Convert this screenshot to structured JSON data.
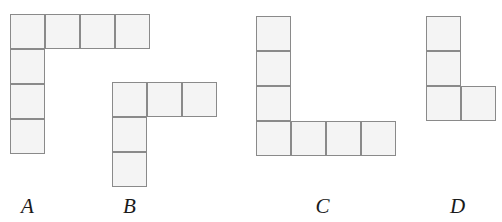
{
  "figure": {
    "kind": "polyomino-shape-set",
    "background_color": "#ffffff",
    "cell_fill_color": "#f4f4f4",
    "cell_border_color": "#8a8a8a",
    "label_color": "#1a1a1a",
    "cell_size_px": 35,
    "shapes": [
      {
        "id": "A",
        "label": "A",
        "cell_count": 7,
        "origin": {
          "x": 10,
          "y": 14
        },
        "label_pos": {
          "x": 10,
          "y": 196,
          "width": 35
        },
        "cells": [
          {
            "col": 0,
            "row": 0
          },
          {
            "col": 1,
            "row": 0
          },
          {
            "col": 2,
            "row": 0
          },
          {
            "col": 3,
            "row": 0
          },
          {
            "col": 0,
            "row": 1
          },
          {
            "col": 0,
            "row": 2
          },
          {
            "col": 0,
            "row": 3
          }
        ]
      },
      {
        "id": "B",
        "label": "B",
        "cell_count": 5,
        "origin": {
          "x": 112,
          "y": 82
        },
        "label_pos": {
          "x": 112,
          "y": 196,
          "width": 35
        },
        "cells": [
          {
            "col": 0,
            "row": 0
          },
          {
            "col": 1,
            "row": 0
          },
          {
            "col": 2,
            "row": 0
          },
          {
            "col": 0,
            "row": 1
          },
          {
            "col": 0,
            "row": 2
          }
        ]
      },
      {
        "id": "C",
        "label": "C",
        "cell_count": 7,
        "origin": {
          "x": 256,
          "y": 16
        },
        "label_pos": {
          "x": 305,
          "y": 196,
          "width": 35
        },
        "cells": [
          {
            "col": 0,
            "row": 0
          },
          {
            "col": 0,
            "row": 1
          },
          {
            "col": 0,
            "row": 2
          },
          {
            "col": 0,
            "row": 3
          },
          {
            "col": 1,
            "row": 3
          },
          {
            "col": 2,
            "row": 3
          },
          {
            "col": 3,
            "row": 3
          }
        ]
      },
      {
        "id": "D",
        "label": "D",
        "cell_count": 4,
        "origin": {
          "x": 426,
          "y": 16
        },
        "label_pos": {
          "x": 440,
          "y": 196,
          "width": 35
        },
        "cells": [
          {
            "col": 0,
            "row": 0
          },
          {
            "col": 0,
            "row": 1
          },
          {
            "col": 0,
            "row": 2
          },
          {
            "col": 1,
            "row": 2
          }
        ]
      }
    ]
  }
}
